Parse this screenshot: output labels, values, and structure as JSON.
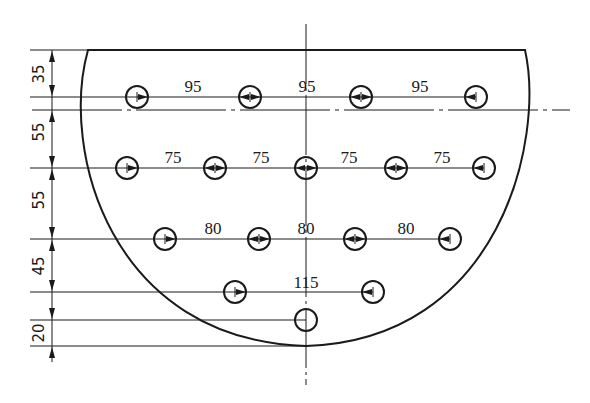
{
  "drawing": {
    "title": "Hole pattern on semicircular plate",
    "stroke_color": "#1a1a1a",
    "centerline_x": 306,
    "center_y": 110,
    "top_edge": {
      "y": 50,
      "x1": 88,
      "x2": 525
    },
    "arc_bottom_y": 346,
    "hole_radius": 11,
    "rows": [
      {
        "y": 97,
        "holes_x": [
          137,
          250,
          361,
          476
        ],
        "spacing_labels": [
          "95",
          "95",
          "95"
        ]
      },
      {
        "y": 168,
        "holes_x": [
          127,
          215,
          306,
          396,
          484
        ],
        "spacing_labels": [
          "75",
          "75",
          "75",
          "75"
        ]
      },
      {
        "y": 239,
        "holes_x": [
          165,
          259,
          355,
          450
        ],
        "spacing_labels": [
          "80",
          "80",
          "80"
        ]
      },
      {
        "y": 292,
        "holes_x": [
          235,
          373
        ],
        "spacing_labels": [
          "115"
        ]
      },
      {
        "y": 320,
        "holes_x": [
          306
        ],
        "spacing_labels": []
      }
    ],
    "vertical_dimensions": [
      {
        "label": "35",
        "y1": 50,
        "y2": 110
      },
      {
        "label": "55",
        "y1": 110,
        "y2": 168
      },
      {
        "label": "55",
        "y1": 168,
        "y2": 239
      },
      {
        "label": "45",
        "y1": 239,
        "y2": 292
      },
      {
        "label": "20",
        "y1": 320,
        "y2": 346
      }
    ]
  }
}
